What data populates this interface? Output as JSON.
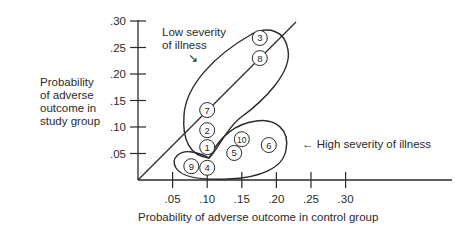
{
  "chart_data": {
    "type": "scatter",
    "title": "",
    "xlabel": "Probability of adverse outcome in control group",
    "ylabel": "Probability of adverse outcome in study group",
    "ylabel_lines": [
      "Probability",
      "of adverse",
      "outcome in",
      "study group"
    ],
    "xlim": [
      0,
      0.35
    ],
    "ylim": [
      0,
      0.3
    ],
    "x_ticks": [
      ".05",
      ".10",
      ".15",
      ".20",
      ".25",
      ".30"
    ],
    "y_ticks": [
      ".05",
      ".10",
      ".15",
      ".20",
      ".25",
      ".30"
    ],
    "grid": false,
    "reference_line": "identity (y = x)",
    "points": [
      {
        "label": "1",
        "x": 0.1,
        "y": 0.062,
        "group": "Low severity of illness"
      },
      {
        "label": "2",
        "x": 0.1,
        "y": 0.094,
        "group": "Low severity of illness"
      },
      {
        "label": "3",
        "x": 0.176,
        "y": 0.268,
        "group": "Low severity of illness"
      },
      {
        "label": "4",
        "x": 0.1,
        "y": 0.023,
        "group": "High severity of illness"
      },
      {
        "label": "5",
        "x": 0.139,
        "y": 0.051,
        "group": "High severity of illness"
      },
      {
        "label": "6",
        "x": 0.189,
        "y": 0.066,
        "group": "High severity of illness"
      },
      {
        "label": "7",
        "x": 0.1,
        "y": 0.132,
        "group": "Low severity of illness"
      },
      {
        "label": "8",
        "x": 0.176,
        "y": 0.23,
        "group": "Low severity of illness"
      },
      {
        "label": "9",
        "x": 0.077,
        "y": 0.026,
        "group": "High severity of illness"
      },
      {
        "label": "10",
        "x": 0.15,
        "y": 0.077,
        "group": "High severity of illness"
      }
    ],
    "annotations": [
      {
        "text": "Low severity of illness",
        "lines": [
          "Low severity",
          "of illness"
        ],
        "arrow": "↘"
      },
      {
        "text": "High severity of illness",
        "arrow": "←"
      }
    ],
    "colors": {
      "ink": "#2a2a2a",
      "background": "#ffffff"
    }
  }
}
